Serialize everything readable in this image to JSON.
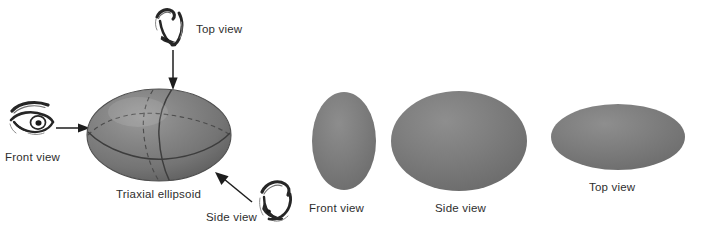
{
  "figure": {
    "background_color": "#ffffff",
    "ink_color": "#2e2e2e",
    "solid_shape_color": "#787878",
    "shape_highlight_color": "#949494",
    "shape_shadow_color": "#585858"
  },
  "main_object": {
    "caption": "Triaxial ellipsoid",
    "caption_name": "triaxial-ellipsoid-caption"
  },
  "viewpoints": [
    {
      "id": "top",
      "label": "Top view",
      "icon_name": "eye-icon-top-view",
      "arrow_name": "arrow-top-view",
      "arrow_direction": "down"
    },
    {
      "id": "front",
      "label": "Front view",
      "icon_name": "eye-icon-front-view",
      "arrow_name": "arrow-front-view",
      "arrow_direction": "right"
    },
    {
      "id": "side",
      "label": "Side view",
      "icon_name": "eye-icon-side-view",
      "arrow_name": "arrow-side-view",
      "arrow_direction": "up-left"
    }
  ],
  "projections": [
    {
      "id": "front",
      "label": "Front view",
      "shape": "ellipse",
      "shape_name": "projection-ellipse-front-view"
    },
    {
      "id": "side",
      "label": "Side view",
      "shape": "ellipse",
      "shape_name": "projection-ellipse-side-view"
    },
    {
      "id": "top",
      "label": "Top view",
      "shape": "ellipse",
      "shape_name": "projection-ellipse-top-view"
    }
  ]
}
